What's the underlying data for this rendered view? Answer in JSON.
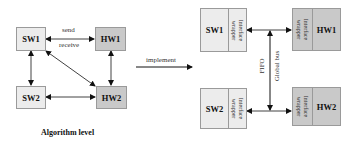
{
  "algorithm_level": {
    "title": "Algorithm level",
    "nodes": {
      "sw1": "SW1",
      "hw1": "HW1",
      "sw2": "SW2",
      "hw2": "HW2"
    },
    "edge_labels": {
      "send": "send",
      "receive": "receive"
    },
    "edges": [
      {
        "from": "SW1",
        "to": "HW1",
        "bidirectional": true
      },
      {
        "from": "SW1",
        "to": "SW2",
        "bidirectional": true
      },
      {
        "from": "SW1",
        "to": "HW2",
        "bidirectional": true
      },
      {
        "from": "HW1",
        "to": "HW2",
        "bidirectional": true
      },
      {
        "from": "SW2",
        "to": "HW2",
        "bidirectional": true
      }
    ]
  },
  "transition": {
    "label": "implement"
  },
  "implementation": {
    "nodes": {
      "sw1": "SW1",
      "hw1": "HW1",
      "sw2": "SW2",
      "hw2": "HW2"
    },
    "wrapper_label": "Interface\nwrapper",
    "bus_labels": {
      "fifo": "FIFO",
      "global_bus": "Global bus"
    }
  },
  "colors": {
    "sw_fill": "#ececec",
    "hw_fill": "#c9c9c9",
    "border": "#9a9a9a",
    "line": "#111111"
  }
}
